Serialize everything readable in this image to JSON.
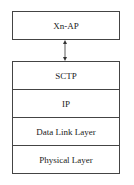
{
  "diagram": {
    "top_box": {
      "label": "Xn-AP"
    },
    "connector": {
      "type": "bidirectional-arrow"
    },
    "stack": [
      {
        "label": "SCTP"
      },
      {
        "label": "IP"
      },
      {
        "label": "Data Link Layer"
      },
      {
        "label": "Physical Layer"
      }
    ]
  }
}
